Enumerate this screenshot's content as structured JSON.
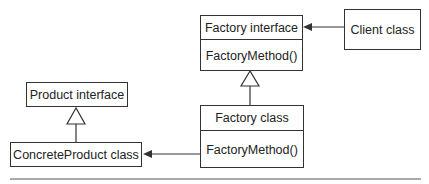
{
  "diagram": {
    "type": "UML class diagram - Factory Method pattern",
    "nodes": [
      {
        "id": "factory_interface",
        "title": "Factory interface",
        "method": "FactoryMethod()"
      },
      {
        "id": "client_class",
        "title": "Client class"
      },
      {
        "id": "product_interface",
        "title": "Product interface"
      },
      {
        "id": "factory_class",
        "title": "Factory class",
        "method": "FactoryMethod()"
      },
      {
        "id": "concrete_product_class",
        "title": "ConcreteProduct class"
      }
    ],
    "edges": [
      {
        "from": "client_class",
        "to": "factory_interface",
        "type": "association-arrow"
      },
      {
        "from": "factory_class",
        "to": "factory_interface",
        "type": "realization-triangle"
      },
      {
        "from": "concrete_product_class",
        "to": "product_interface",
        "type": "realization-triangle"
      },
      {
        "from": "factory_class",
        "to": "concrete_product_class",
        "type": "association-arrow"
      }
    ],
    "colors": {
      "line": "#333333",
      "background": "#ffffff"
    }
  }
}
